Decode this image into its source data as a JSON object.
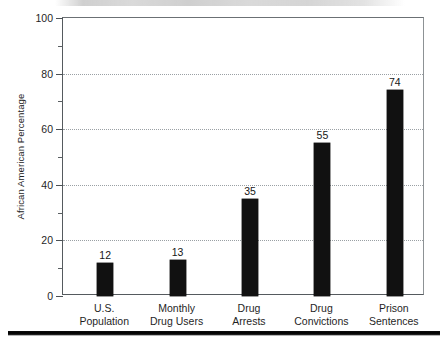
{
  "chart_data": {
    "type": "bar",
    "title": "",
    "xlabel": "",
    "ylabel": "African American Percentage",
    "ylim": [
      0,
      100
    ],
    "grid": "horizontal-dotted-at-major-ticks",
    "legend": "none",
    "categories": [
      "U.S. Population",
      "Monthly Drug Users",
      "Drug Arrests",
      "Drug Convictions",
      "Prison Sentences"
    ],
    "category_lines": [
      [
        "U.S.",
        "Population"
      ],
      [
        "Monthly",
        "Drug Users"
      ],
      [
        "Drug",
        "Arrests"
      ],
      [
        "Drug",
        "Convictions"
      ],
      [
        "Prison",
        "Sentences"
      ]
    ],
    "values": [
      12,
      13,
      35,
      55,
      74
    ],
    "value_labels": [
      "12",
      "13",
      "35",
      "55",
      "74"
    ],
    "yticks_major": [
      0,
      20,
      40,
      60,
      80,
      100
    ],
    "ytick_labels": [
      "0",
      "20",
      "40",
      "60",
      "80",
      "100"
    ],
    "yticks_minor": [
      10,
      30,
      50,
      70,
      90
    ],
    "gridline_values": [
      20,
      40,
      60,
      80
    ],
    "bar_color": "#111111",
    "axis_color": "#555a5e",
    "grid_color": "#9aa0a4",
    "background_color": "#ffffff"
  }
}
